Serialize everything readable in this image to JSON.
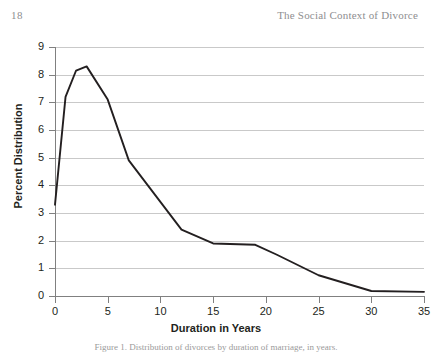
{
  "page": {
    "folio": "18",
    "running_title": "The Social Context of Divorce"
  },
  "caption": {
    "text": "Figure 1.  Distribution of divorces by duration of marriage, in years."
  },
  "chart_data": {
    "type": "line",
    "title": "",
    "xlabel": "Duration in Years",
    "ylabel": "Percent Distribution",
    "xlim": [
      0,
      35
    ],
    "ylim": [
      0,
      9
    ],
    "xticks": [
      0,
      5,
      10,
      15,
      20,
      25,
      30,
      35
    ],
    "yticks": [
      0,
      1,
      2,
      3,
      4,
      5,
      6,
      7,
      8,
      9
    ],
    "xtick_labels": [
      "0",
      "5",
      "10",
      "15",
      "20",
      "25",
      "30",
      "35"
    ],
    "ytick_labels": [
      "0",
      "1",
      "2",
      "3",
      "4",
      "5",
      "6",
      "7",
      "8",
      "9"
    ],
    "grid": "horizontal",
    "legend": "none",
    "line_color": "#231f20",
    "grid_color": "#c9c9c9",
    "axis_color": "#808080",
    "x": [
      0,
      1,
      2,
      3,
      5,
      7,
      12,
      15,
      19,
      21,
      25,
      30,
      35
    ],
    "values": [
      3.3,
      7.2,
      8.15,
      8.3,
      7.1,
      4.9,
      2.4,
      1.9,
      1.85,
      1.5,
      0.75,
      0.18,
      0.15
    ]
  }
}
